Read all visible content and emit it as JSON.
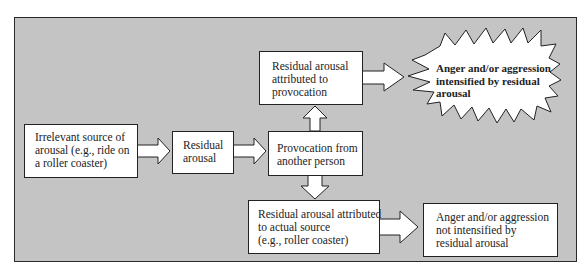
{
  "diagram": {
    "nodes": {
      "irrelevant_source": {
        "lines": [
          "Irrelevant source of",
          "arousal (e.g., ride on",
          "a roller coaster)"
        ]
      },
      "residual_arousal": {
        "lines": [
          "Residual",
          "arousal"
        ]
      },
      "provocation": {
        "lines": [
          "Provocation from",
          "another person"
        ]
      },
      "attributed_provocation": {
        "lines": [
          "Residual arousal",
          "attributed to",
          "provocation"
        ]
      },
      "intensified": {
        "lines": [
          "Anger and/or aggression",
          "intensified by residual",
          "arousal"
        ]
      },
      "attributed_actual": {
        "lines": [
          "Residual arousal attributed",
          "to actual source",
          "(e.g., roller coaster)"
        ]
      },
      "not_intensified": {
        "lines": [
          "Anger and/or aggression",
          "not intensified by",
          "residual arousal"
        ]
      }
    },
    "edges": [
      {
        "from": "irrelevant_source",
        "to": "residual_arousal"
      },
      {
        "from": "residual_arousal",
        "to": "provocation"
      },
      {
        "from": "provocation",
        "to": "attributed_provocation"
      },
      {
        "from": "provocation",
        "to": "attributed_actual"
      },
      {
        "from": "attributed_provocation",
        "to": "intensified"
      },
      {
        "from": "attributed_actual",
        "to": "not_intensified"
      }
    ],
    "colors": {
      "panel": "#c4c4c4",
      "box": "#ffffff",
      "stroke": "#222222"
    }
  }
}
